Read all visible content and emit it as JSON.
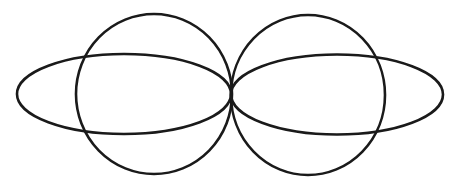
{
  "figure": {
    "width": 460,
    "height": 186,
    "background": "#ffffff",
    "stroke_color": "#1a1a1a",
    "stroke_width": 2.6
  },
  "shapes": {
    "left_circle": {
      "cx": 154,
      "cy": 94,
      "rx": 78,
      "ry": 80
    },
    "right_circle": {
      "cx": 308,
      "cy": 95,
      "rx": 77,
      "ry": 80
    },
    "left_ellipse": {
      "cx": 124,
      "cy": 94,
      "rx": 107,
      "ry": 40
    },
    "right_ellipse": {
      "cx": 337,
      "cy": 94.5,
      "rx": 106,
      "ry": 40
    }
  }
}
